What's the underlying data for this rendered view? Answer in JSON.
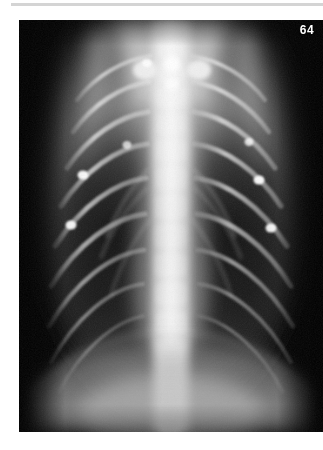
{
  "page": {
    "background_color": "#ffffff",
    "width": 323,
    "height": 450
  },
  "top_rule": {
    "color": "#d4d4d4"
  },
  "figure": {
    "number": "64",
    "number_color": "#ffffff",
    "modality": "radiograph",
    "view": "dorsoventral thoracic radiograph",
    "caption": "",
    "plate": {
      "background_color": "#000000",
      "x": 19,
      "y": 20,
      "width": 304,
      "height": 412
    },
    "anatomy_labels": [
      "thoracic spine",
      "ribs",
      "lung field left",
      "lung field right",
      "mediastinum",
      "diaphragm",
      "costochondral junctions",
      "scapula"
    ]
  }
}
